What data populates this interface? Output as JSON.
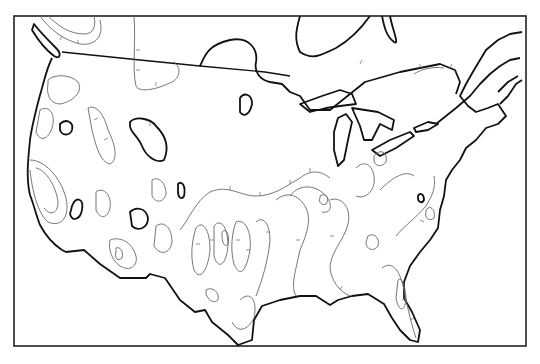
{
  "map": {
    "region": "Contiguous United States and southern Canada",
    "style": "black-and-white isoline map with hachured contours",
    "colors": {
      "background": "#ffffff",
      "coastline": "#111111",
      "isoline": "#666666",
      "frame": "#222222"
    },
    "labels": []
  }
}
